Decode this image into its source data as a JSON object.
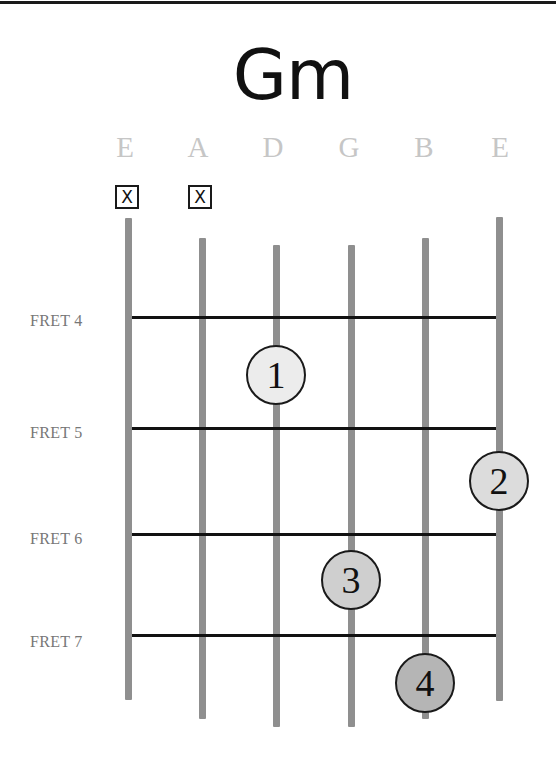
{
  "chord": {
    "name": "Gm"
  },
  "strings": [
    {
      "label": "E",
      "x": 128,
      "top": 218,
      "bottom": 700,
      "muted": true,
      "mute_symbol": "X"
    },
    {
      "label": "A",
      "x": 202,
      "top": 238,
      "bottom": 719,
      "muted": true,
      "mute_symbol": "X"
    },
    {
      "label": "D",
      "x": 276,
      "top": 245,
      "bottom": 727,
      "muted": false
    },
    {
      "label": "G",
      "x": 351,
      "top": 245,
      "bottom": 727,
      "muted": false
    },
    {
      "label": "B",
      "x": 425,
      "top": 238,
      "bottom": 719,
      "muted": false
    },
    {
      "label": "E",
      "x": 499,
      "top": 217,
      "bottom": 701,
      "muted": false
    }
  ],
  "frets": [
    {
      "label": "FRET 4",
      "y": 317
    },
    {
      "label": "FRET 5",
      "y": 428
    },
    {
      "label": "FRET 6",
      "y": 534
    },
    {
      "label": "FRET 7",
      "y": 635
    }
  ],
  "fingers": [
    {
      "number": "1",
      "string": "D",
      "fret": 4,
      "x": 276,
      "y": 375,
      "fill": "#ececec"
    },
    {
      "number": "2",
      "string": "E (high)",
      "fret": 5,
      "x": 499,
      "y": 481,
      "fill": "#dcdcdc"
    },
    {
      "number": "3",
      "string": "G",
      "fret": 6,
      "x": 351,
      "y": 580,
      "fill": "#cfcfcf"
    },
    {
      "number": "4",
      "string": "B",
      "fret": 7,
      "x": 425,
      "y": 683,
      "fill": "#b5b5b5"
    }
  ],
  "colors": {
    "string": "#8f8f8f",
    "fret": "#111111",
    "string_label": "#c6c6c6",
    "fret_label": "#777777"
  }
}
